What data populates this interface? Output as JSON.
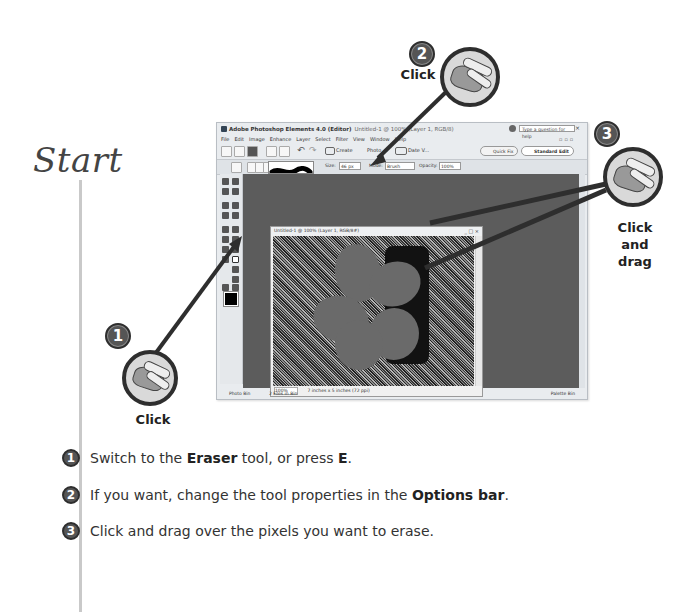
{
  "page": {
    "heading": "Start",
    "colors": {
      "timeline": "#c9c9c9",
      "badge": "#555555",
      "workspace": "#5c5c5c"
    }
  },
  "app": {
    "title": "Adobe Photoshop Elements 4.0 (Editor)",
    "title_sub": "Untitled-1 @ 100% (Layer 1, RGB/8)",
    "menu": [
      "File",
      "Edit",
      "Image",
      "Enhance",
      "Layer",
      "Select",
      "Filter",
      "View",
      "Window",
      "Help"
    ],
    "toolbar": {
      "create_label": "Create",
      "photo_label": "Photo ...",
      "date_label": "Date V...",
      "help_placeholder": "Type a question for help",
      "quick_fix_label": "Quick Fix",
      "standard_edit_label": "Standard Edit"
    },
    "options_bar": {
      "size_label": "Size:",
      "size_value": "46 px",
      "mode_label": "Mode:",
      "mode_value": "Brush",
      "opacity_label": "Opacity:",
      "opacity_value": "100%"
    },
    "document": {
      "title": "Untitled-1 @ 100% (Layer 1, RGB/8#)",
      "zoom": "100%",
      "dimensions": "7 inches x 5 inches (72 ppi)"
    },
    "statusbar": {
      "photo_bin": "Photo Bin",
      "files_in_bin": "2 Files in Bin",
      "palette_bin": "Palette Bin"
    },
    "window_controls": "_ □ ×"
  },
  "callouts": [
    {
      "number": "1",
      "label": "Click"
    },
    {
      "number": "2",
      "label": "Click"
    },
    {
      "number": "3",
      "label": "Click and drag"
    }
  ],
  "steps": [
    {
      "number": "1",
      "pre": "Switch to the ",
      "bold1": "Eraser",
      "mid": " tool, or press ",
      "bold2": "E",
      "post": "."
    },
    {
      "number": "2",
      "pre": "If you want, change the tool properties in the ",
      "bold1": "Options bar",
      "post": "."
    },
    {
      "number": "3",
      "pre": "Click and drag over the pixels you want to erase."
    }
  ]
}
